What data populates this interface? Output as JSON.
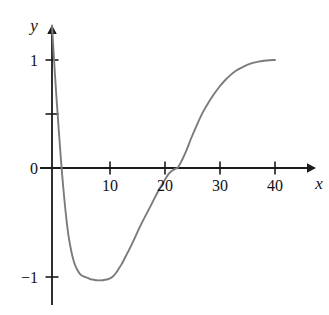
{
  "chart_data": {
    "type": "line",
    "title": "",
    "subtitle": "",
    "xlabel": "x",
    "ylabel": "y",
    "xlim": [
      -1.5,
      46
    ],
    "ylim": [
      -1.45,
      1.35
    ],
    "xticks": [
      10,
      20,
      30,
      40
    ],
    "xtick_labels": [
      "10",
      "20",
      "30",
      "40"
    ],
    "yticks": [
      1,
      0,
      -1
    ],
    "ytick_labels": [
      "1",
      "0",
      "−1"
    ],
    "origin_label": "0",
    "grid": false,
    "legend": null,
    "annotations": [],
    "axis_arrows": {
      "x": true,
      "y": true
    },
    "series": [
      {
        "name": "curve",
        "color": "#7b7b7b",
        "linewidth": 1.9,
        "x": [
          0.0,
          0.3,
          0.6,
          0.9,
          1.2,
          1.5,
          1.8,
          2.2,
          2.6,
          3.0,
          3.5,
          4.0,
          4.5,
          5.0,
          5.5,
          6.0,
          6.5,
          7.0,
          7.5,
          8.0,
          8.5,
          9.0,
          9.5,
          10.0,
          10.5,
          11.0,
          11.5,
          12.0,
          12.5,
          13.0,
          14.0,
          15.0,
          16.0,
          17.0,
          18.0,
          19.0,
          20.0,
          21.0,
          22.0,
          22.5,
          23.0,
          24.0,
          25.0,
          26.0,
          27.0,
          28.0,
          29.0,
          30.0,
          31.0,
          32.0,
          33.0,
          34.0,
          35.0,
          36.0,
          37.0,
          38.0,
          39.0,
          40.0
        ],
        "y": [
          1.32,
          1.06,
          0.81,
          0.58,
          0.36,
          0.15,
          -0.05,
          -0.28,
          -0.48,
          -0.64,
          -0.78,
          -0.88,
          -0.94,
          -0.98,
          -1.0,
          -1.01,
          -1.02,
          -1.03,
          -1.035,
          -1.04,
          -1.04,
          -1.04,
          -1.035,
          -1.03,
          -1.02,
          -1.0,
          -0.97,
          -0.93,
          -0.89,
          -0.84,
          -0.74,
          -0.63,
          -0.52,
          -0.42,
          -0.32,
          -0.22,
          -0.13,
          -0.05,
          -0.01,
          0.0,
          0.04,
          0.15,
          0.28,
          0.4,
          0.51,
          0.6,
          0.68,
          0.75,
          0.81,
          0.86,
          0.9,
          0.93,
          0.955,
          0.973,
          0.985,
          0.993,
          0.998,
          1.0
        ]
      }
    ],
    "key_points": {
      "y_intercept_approx": 1.32,
      "first_zero_crossing_x": 1.7,
      "minimum": {
        "x": 8.5,
        "y": -1.04
      },
      "second_zero_crossing_x": 22.5,
      "right_endpoint": {
        "x": 40,
        "y": 1.0
      }
    },
    "colors": {
      "curve": "#7b7b7b",
      "axis": "#1a1a1a",
      "text": "#111111",
      "background": "#ffffff"
    }
  }
}
